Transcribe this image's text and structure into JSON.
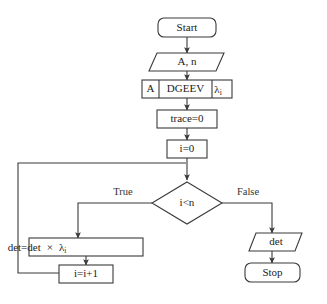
{
  "diagram": {
    "background_color": "#ffffff",
    "stroke_color": "#3a3a3a",
    "text_color": "#222222"
  },
  "nodes": {
    "start": {
      "label": "Start",
      "shape": "stadium"
    },
    "input": {
      "label": "A, n",
      "shape": "parallelogram"
    },
    "call": {
      "shape": "multi-cell-process",
      "cells": [
        {
          "label": "A"
        },
        {
          "label": "DGEEV"
        },
        {
          "label": "λ",
          "subscript": "i"
        }
      ]
    },
    "init_trace": {
      "label": "trace=0",
      "shape": "process"
    },
    "init_i": {
      "label": "i=0",
      "shape": "process"
    },
    "decision": {
      "label": "i<n",
      "shape": "diamond"
    },
    "accumulate": {
      "shape": "process",
      "label_parts": [
        {
          "text": "det=det"
        },
        {
          "text": "×"
        },
        {
          "text": "λ",
          "subscript": "i"
        }
      ]
    },
    "increment": {
      "label": "i=i+1",
      "shape": "process"
    },
    "output": {
      "label": "det",
      "shape": "parallelogram"
    },
    "stop": {
      "label": "Stop",
      "shape": "stadium"
    }
  },
  "branch_labels": {
    "true": "True",
    "false": "False"
  },
  "icons": {
    "arrowhead": "arrow-head-icon"
  }
}
